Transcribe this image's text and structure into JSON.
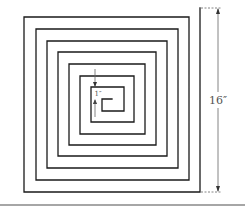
{
  "figure": {
    "type": "square-spiral",
    "colors": {
      "line": "#1a1a1a",
      "dimension": "#666666",
      "label": "#555555",
      "baseline": "#888888"
    },
    "spiral_points": [
      [
        200,
        8
      ],
      [
        200,
        192
      ],
      [
        24,
        192
      ],
      [
        24,
        17
      ],
      [
        189,
        17
      ],
      [
        189,
        180
      ],
      [
        36,
        180
      ],
      [
        36,
        29
      ],
      [
        178,
        29
      ],
      [
        178,
        168
      ],
      [
        47,
        168
      ],
      [
        47,
        41
      ],
      [
        167,
        41
      ],
      [
        167,
        156
      ],
      [
        58,
        156
      ],
      [
        58,
        52
      ],
      [
        156,
        52
      ],
      [
        156,
        145
      ],
      [
        69,
        145
      ],
      [
        69,
        64
      ],
      [
        145,
        64
      ],
      [
        145,
        134
      ],
      [
        80,
        134
      ],
      [
        80,
        76
      ],
      [
        134,
        76
      ],
      [
        134,
        122
      ],
      [
        91,
        122
      ],
      [
        91,
        87
      ],
      [
        124,
        87
      ],
      [
        124,
        111
      ],
      [
        102,
        111
      ],
      [
        102,
        99
      ],
      [
        112,
        99
      ]
    ]
  },
  "labels": {
    "overall_height": "16″",
    "spacing": "1″"
  }
}
